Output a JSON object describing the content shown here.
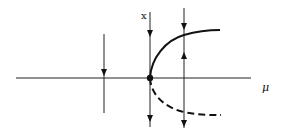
{
  "diagram": {
    "type": "saddle-node bifurcation diagram",
    "axes": {
      "horizontal_label": "μ",
      "vertical_label": "x"
    },
    "branches": [
      {
        "name": "stable-branch",
        "style": "solid"
      },
      {
        "name": "unstable-branch",
        "style": "dashed"
      }
    ],
    "bifurcation_point": {
      "marker": "filled-dot"
    },
    "flow_lines": [
      {
        "position": "left of bifurcation",
        "arrows": [
          "down"
        ]
      },
      {
        "position": "at bifurcation",
        "arrows": [
          "down",
          "down"
        ]
      },
      {
        "position": "right of bifurcation",
        "arrows": [
          "down",
          "up",
          "down"
        ]
      }
    ],
    "colors": {
      "ink": "#111111",
      "background": "#ffffff"
    }
  }
}
